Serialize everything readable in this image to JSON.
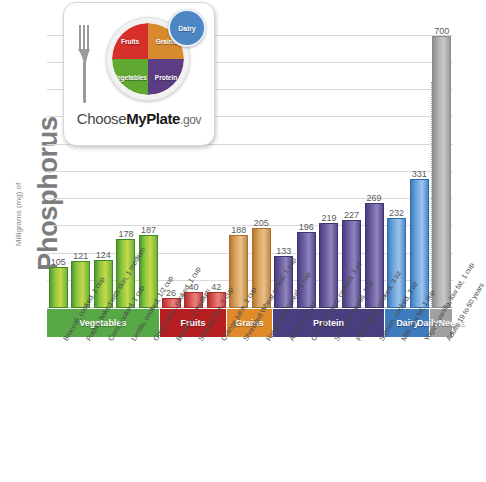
{
  "axis": {
    "y_title_main": "Phosphorus",
    "y_title_sub": "Milligrams (mg) of"
  },
  "logo": {
    "fruits": "Fruits",
    "grains": "Grains",
    "vegetables": "Vegetables",
    "protein": "Protein",
    "dairy": "Dairy",
    "wordmark_pre": "Choose",
    "wordmark_bold": "MyPlate",
    "wordmark_post": ".gov"
  },
  "bands": [
    {
      "label": "Vegetables",
      "color": "#57a846",
      "start": 0,
      "count": 5
    },
    {
      "label": "Fruits",
      "color": "#b51f22",
      "start": 5,
      "count": 3
    },
    {
      "label": "Grains",
      "color": "#e08a2a",
      "start": 8,
      "count": 2
    },
    {
      "label": "Protein",
      "color": "#4a3d80",
      "start": 10,
      "count": 5
    },
    {
      "label": "Dairy",
      "color": "#3d7cbd",
      "start": 15,
      "count": 2
    },
    {
      "label": "Daily\nNeeds",
      "color": "#a0a0a0",
      "start": 17,
      "count": 1
    }
  ],
  "chart_data": {
    "type": "bar",
    "xlabel": "",
    "ylabel": "Milligrams (mg) of Phosphorus",
    "ylim": [
      0,
      740
    ],
    "grid": true,
    "gridline_values": [
      70,
      140,
      210,
      280,
      350,
      420,
      490,
      560,
      630,
      700
    ],
    "legend": "none",
    "categories": [
      "Broccoli, cooked, 1 cup",
      "Potato, baked with skin, 1 medium",
      "Corn, cooked, 1 cup",
      "Lentils, cooked, 1/2 cup",
      "Green peas, cooked, 1 cup",
      "Banana, 1 medium",
      "Strawberries, 1 cup",
      "Orange juice, 1 cup",
      "Shredded Wheat cereal, 1 cup",
      "Raisin Bran cereal, 1 cup",
      "Almonds, 1 oz",
      "Chicken breast, cooked, 3 oz",
      "Sunflower seeds, 1 oz",
      "Flank steak, cooked, 3 oz",
      "Salmon, cooked, 3 oz",
      "Milk, low fat, 1 cup",
      "Yogurt, vanilla, low fat, 1 cup",
      "Adults 19 to 50 years"
    ],
    "values": [
      105,
      121,
      124,
      178,
      187,
      26,
      40,
      42,
      188,
      205,
      133,
      196,
      219,
      227,
      269,
      232,
      331,
      700
    ],
    "group_of": [
      "Vegetables",
      "Vegetables",
      "Vegetables",
      "Vegetables",
      "Vegetables",
      "Fruits",
      "Fruits",
      "Fruits",
      "Grains",
      "Grains",
      "Protein",
      "Protein",
      "Protein",
      "Protein",
      "Protein",
      "Dairy",
      "Dairy",
      "Daily Needs"
    ],
    "bar_colors": {
      "Vegetables": "#8cc63f",
      "Fruits": "#d9534f",
      "Grains": "#d9a05b",
      "Protein": "#6a5a9e",
      "Dairy": "#6ba3dc",
      "Daily Needs": "#a8a8a8"
    },
    "annotations": [
      {
        "text": "dotted reference line at Daily Needs bar",
        "value": 700
      }
    ]
  }
}
